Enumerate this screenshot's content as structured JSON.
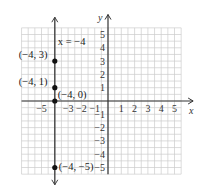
{
  "chart_data": {
    "type": "scatter",
    "title": "",
    "xlabel": "x",
    "ylabel": "y",
    "xlim": [
      -6,
      6
    ],
    "ylim": [
      -6,
      6
    ],
    "grid": true,
    "x_ticks": [
      -5,
      -3,
      -2,
      -1,
      1,
      2,
      3,
      4,
      5
    ],
    "x_tick_labels": [
      "−5",
      "−3",
      "−2",
      "−1",
      "1",
      "2",
      "3",
      "4",
      "5"
    ],
    "y_ticks": [
      5,
      4,
      3,
      2,
      1,
      -1,
      -2,
      -3,
      -4,
      -5
    ],
    "y_tick_labels": [
      "5",
      "4",
      "3",
      "2",
      "1",
      "−1",
      "−2",
      "−3",
      "−4",
      "−5"
    ],
    "line": {
      "equation": "x = −4",
      "label": "x = −4",
      "type": "vertical",
      "x": -4
    },
    "points": [
      {
        "x": -4,
        "y": 3,
        "label": "(−4, 3)"
      },
      {
        "x": -4,
        "y": 1,
        "label": "(−4, 1)"
      },
      {
        "x": -4,
        "y": 0,
        "label": "(−4, 0)"
      },
      {
        "x": -4,
        "y": -5,
        "label": "(−4, −5)"
      }
    ],
    "colors": {
      "axis": "#333333",
      "grid": "#cccccc",
      "line": "#444444",
      "point": "#111111"
    }
  }
}
